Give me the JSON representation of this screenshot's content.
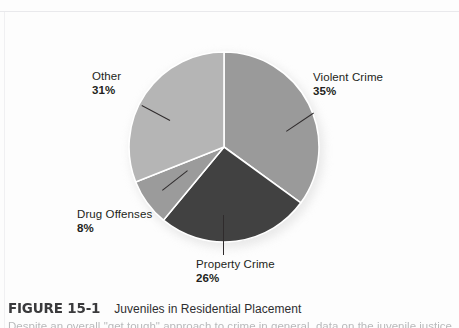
{
  "figure": {
    "number": "FIGURE 15-1",
    "title": "Juveniles in Residential Placement",
    "body": "Despite an overall \"get tough\" approach to crime in general, data on the juvenile justice"
  },
  "chart_data": {
    "type": "pie",
    "title": "Juveniles in Residential Placement",
    "unit": "%",
    "start_angle_deg": 0,
    "direction": "clockwise",
    "legend": "none",
    "labels_inline": true,
    "categories": [
      "Violent Crime",
      "Property Crime",
      "Drug Offenses",
      "Other"
    ],
    "values": [
      35,
      26,
      8,
      31
    ],
    "total": 100,
    "slices": [
      {
        "name": "Violent Crime",
        "value": 35,
        "percent_label": "35%",
        "color": "#9a9a9a",
        "label_position": "right"
      },
      {
        "name": "Property Crime",
        "value": 26,
        "percent_label": "26%",
        "color": "#414141",
        "label_position": "bottom"
      },
      {
        "name": "Drug Offenses",
        "value": 8,
        "percent_label": "8%",
        "color": "#9b9b9b",
        "label_position": "left-bottom"
      },
      {
        "name": "Other",
        "value": 31,
        "percent_label": "31%",
        "color": "#b5b5b5",
        "label_position": "left-top"
      }
    ]
  },
  "colors": {
    "page_background": "#fdfdfd",
    "text": "#231f20",
    "caption_number": "#3a3a3c",
    "slice_divider": "#ffffff",
    "leader_line": "#2f2b2c"
  }
}
